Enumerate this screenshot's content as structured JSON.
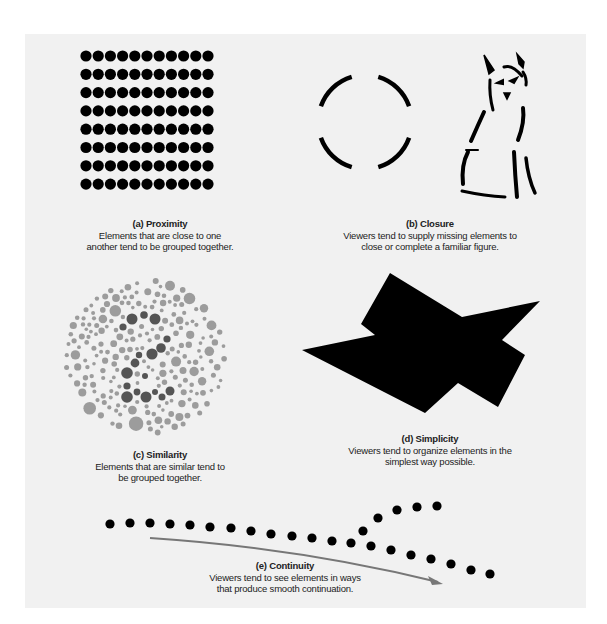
{
  "figure": {
    "panels": [
      {
        "id": "a",
        "title": "(a) Proximity",
        "description_lines": [
          "Elements that are close to one",
          "another tend to be grouped together."
        ],
        "illustration": {
          "type": "dot-grid",
          "columns": 11,
          "rows": 8,
          "color": "#000000"
        }
      },
      {
        "id": "b",
        "title": "(b) Closure",
        "description_lines": [
          "Viewers tend to supply missing elements to",
          "close or complete a familiar figure."
        ],
        "illustration": {
          "type": "broken-circle-and-dog-outline",
          "color": "#000000"
        }
      },
      {
        "id": "c",
        "title": "(c) Similarity",
        "description_lines": [
          "Elements that are similar tend to",
          "be grouped together."
        ],
        "illustration": {
          "type": "ishihara-plate",
          "hidden_figure": "2",
          "light_color": "#9c9c9c",
          "dark_color": "#555555"
        }
      },
      {
        "id": "d",
        "title": "(d) Simplicity",
        "description_lines": [
          "Viewers tend to organize elements in the",
          "simplest way possible."
        ],
        "illustration": {
          "type": "overlapping-shapes",
          "color": "#000000"
        }
      },
      {
        "id": "e",
        "title": "(e) Continuity",
        "description_lines": [
          "Viewers tend to see elements in ways",
          "that produce smooth continuation."
        ],
        "illustration": {
          "type": "dotted-paths-with-arrow",
          "dot_color": "#000000",
          "arrow_color": "#777777"
        }
      }
    ]
  }
}
